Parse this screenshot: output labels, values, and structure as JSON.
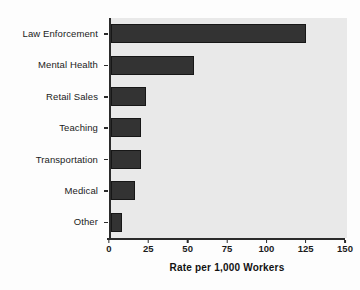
{
  "chart_data": {
    "type": "bar",
    "orientation": "horizontal",
    "title": "",
    "xlabel": "Rate per 1,000 Workers",
    "ylabel": "",
    "xlim": [
      0,
      150
    ],
    "xticks": [
      0,
      25,
      50,
      75,
      100,
      125,
      150
    ],
    "grid": false,
    "legend": false,
    "categories": [
      "Law Enforcement",
      "Mental Health",
      "Retail Sales",
      "Teaching",
      "Transportation",
      "Medical",
      "Other"
    ],
    "values": [
      124,
      53,
      22,
      19,
      19,
      15,
      7
    ],
    "bar_color": "#333333",
    "plot_background": "#e9e9e9",
    "axis_color": "#2b2b2b"
  },
  "axis": {
    "x_title": "Rate per 1,000 Workers",
    "tick_labels": [
      "0",
      "25",
      "50",
      "75",
      "100",
      "125",
      "150"
    ]
  }
}
